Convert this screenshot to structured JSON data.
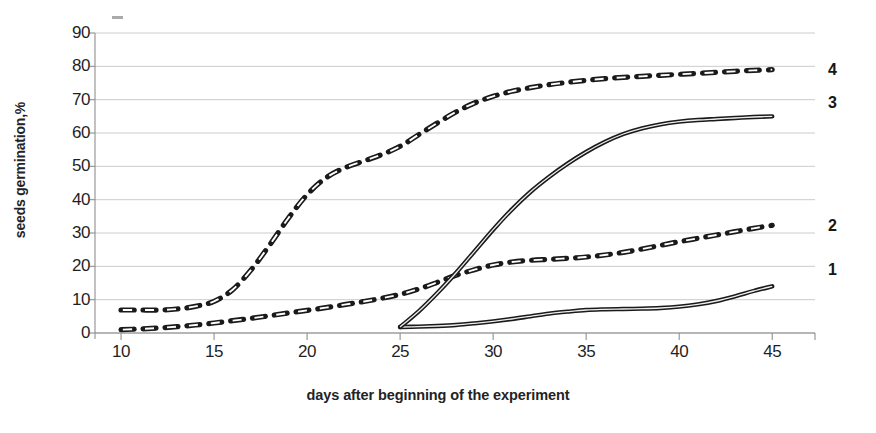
{
  "chart_data": {
    "type": "line",
    "title": "",
    "xlabel": "days after beginning of the experiment",
    "ylabel": "seeds germination,%",
    "xlim": [
      8.6,
      47.3
    ],
    "ylim": [
      0,
      90
    ],
    "xticks": [
      10,
      15,
      20,
      25,
      30,
      35,
      40,
      45
    ],
    "yticks": [
      0,
      10,
      20,
      30,
      40,
      50,
      60,
      70,
      80,
      90
    ],
    "grid": true,
    "legend_position": "right-of-plot",
    "series": [
      {
        "name": "1",
        "label": "1",
        "style": "solid",
        "color": "#1a1a1a",
        "x": [
          25,
          26,
          27,
          28,
          29,
          30,
          31,
          32,
          33,
          34,
          35,
          36,
          37,
          38,
          39,
          40,
          41,
          42,
          43,
          44,
          45
        ],
        "values": [
          1.8,
          1.9,
          2.1,
          2.4,
          2.9,
          3.5,
          4.2,
          5.0,
          5.8,
          6.4,
          6.9,
          7.1,
          7.2,
          7.3,
          7.5,
          7.9,
          8.6,
          9.6,
          11.0,
          12.6,
          14.0
        ]
      },
      {
        "name": "2",
        "label": "2",
        "style": "dashed",
        "color": "#1a1a1a",
        "x": [
          10,
          11,
          12,
          13,
          14,
          15,
          16,
          17,
          18,
          19,
          20,
          21,
          22,
          23,
          24,
          25,
          26,
          27,
          28,
          29,
          30,
          31,
          32,
          33,
          34,
          35,
          36,
          37,
          38,
          39,
          40,
          41,
          42,
          43,
          44,
          45
        ],
        "values": [
          1.0,
          1.2,
          1.5,
          1.9,
          2.4,
          3.0,
          3.7,
          4.4,
          5.2,
          6.0,
          6.8,
          7.6,
          8.5,
          9.4,
          10.4,
          11.6,
          13.2,
          15.2,
          17.3,
          19.0,
          20.4,
          21.3,
          21.8,
          22.1,
          22.4,
          22.8,
          23.4,
          24.2,
          25.2,
          26.3,
          27.4,
          28.4,
          29.4,
          30.4,
          31.4,
          32.3
        ]
      },
      {
        "name": "3",
        "label": "3",
        "style": "solid",
        "color": "#1a1a1a",
        "x": [
          25,
          26,
          27,
          28,
          29,
          30,
          31,
          32,
          33,
          34,
          35,
          36,
          37,
          38,
          39,
          40,
          41,
          42,
          43,
          44,
          45
        ],
        "values": [
          1.8,
          6.5,
          12.0,
          18.0,
          24.5,
          31.0,
          37.0,
          42.3,
          46.8,
          50.8,
          54.3,
          57.3,
          59.7,
          61.4,
          62.6,
          63.4,
          63.9,
          64.2,
          64.5,
          64.8,
          65.0
        ]
      },
      {
        "name": "4",
        "label": "4",
        "style": "dashed",
        "color": "#1a1a1a",
        "x": [
          10,
          11,
          12,
          13,
          14,
          15,
          16,
          17,
          18,
          19,
          20,
          21,
          22,
          23,
          24,
          25,
          26,
          27,
          28,
          29,
          30,
          31,
          32,
          33,
          34,
          35,
          36,
          37,
          38,
          39,
          40,
          41,
          42,
          43,
          44,
          45
        ],
        "values": [
          6.9,
          6.9,
          6.9,
          7.2,
          8.0,
          9.5,
          13.0,
          19.0,
          26.5,
          34.5,
          41.5,
          46.5,
          49.5,
          51.5,
          53.5,
          56.0,
          59.5,
          63.0,
          66.3,
          69.0,
          71.0,
          72.5,
          73.6,
          74.5,
          75.2,
          75.8,
          76.3,
          76.7,
          77.0,
          77.3,
          77.6,
          77.9,
          78.2,
          78.5,
          78.8,
          79.0
        ]
      }
    ]
  },
  "axis": {
    "y_title": "seeds germination,%",
    "x_title": "days after beginning of the experiment",
    "y_tick_labels": [
      "90",
      "80",
      "70",
      "60",
      "50",
      "40",
      "30",
      "20",
      "10",
      "0"
    ],
    "x_tick_labels": [
      "10",
      "15",
      "20",
      "25",
      "30",
      "35",
      "40",
      "45"
    ]
  },
  "series_labels": [
    {
      "text": "4",
      "value": 79
    },
    {
      "text": "3",
      "value": 69
    },
    {
      "text": "2",
      "value": 32
    },
    {
      "text": "1",
      "value": 19
    }
  ],
  "colors": {
    "line": "#1a1a1a",
    "grid": "#b9b9b9",
    "axis": "#8f8f8f",
    "text": "#1f1f1f",
    "background": "#ffffff"
  }
}
